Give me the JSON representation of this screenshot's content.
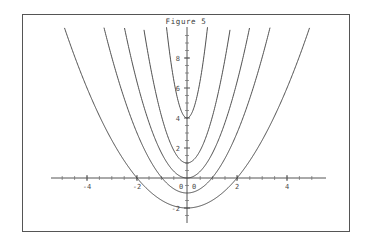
{
  "figure": {
    "title": "Figure 5",
    "background_color": "#ffffff",
    "border_color": "#555555",
    "curve_color": "#3c3c3c",
    "axis_color": "#555555"
  },
  "chart_data": {
    "type": "line",
    "title": "Figure 5",
    "xlabel": "",
    "ylabel": "",
    "xlim": [
      -5.6,
      5.6
    ],
    "ylim": [
      -2.6,
      9.2
    ],
    "grid": false,
    "legend": "none",
    "x_ticks_major": [
      -4,
      -2,
      0,
      2,
      4
    ],
    "x_tick_labels": [
      "-4",
      "-2",
      "0",
      "2",
      "4"
    ],
    "y_ticks_major": [
      -2,
      0,
      2,
      4,
      6,
      8
    ],
    "y_tick_labels": [
      "-2",
      "0",
      "2",
      "4",
      "6",
      "8"
    ],
    "minor_tick_step": 0.5,
    "series": [
      {
        "name": "y = 0.5x^2 - 2",
        "a": 0.5,
        "c": -2,
        "x_from": -4.7,
        "x_to": 4.7
      },
      {
        "name": "y = 1.0x^2 - 1",
        "a": 1.0,
        "c": -1,
        "x_from": -3.2,
        "x_to": 3.2
      },
      {
        "name": "y = 1.6x^2 + 0",
        "a": 1.6,
        "c": 0,
        "x_from": -2.4,
        "x_to": 2.4
      },
      {
        "name": "y = 3.0x^2 + 1",
        "a": 3.0,
        "c": 1,
        "x_from": -1.65,
        "x_to": 1.65
      },
      {
        "name": "y = 9.0x^2 + 4",
        "a": 9.0,
        "c": 4,
        "x_from": -0.78,
        "x_to": 0.78
      },
      {
        "name": "y = -9.0x^2 + 4 mirrored pair left",
        "a": 9.0,
        "c": 4,
        "x_from": -0.78,
        "x_to": 0.78
      }
    ],
    "values_note": "Parabolas are drawn clipped to the plot frame; outer curves exit through the top edge"
  }
}
